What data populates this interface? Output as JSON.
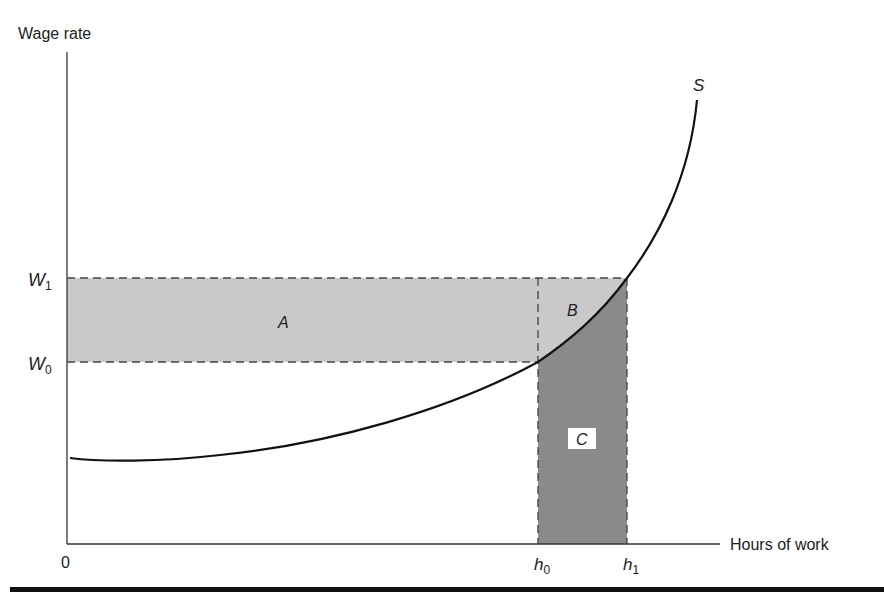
{
  "figure": {
    "y_axis_label": "Wage rate",
    "x_axis_label": "Hours of work",
    "origin_label": "0",
    "curve_label": "S",
    "y_ticks": [
      {
        "base": "W",
        "sub": "1"
      },
      {
        "base": "W",
        "sub": "0"
      }
    ],
    "x_ticks": [
      {
        "base": "h",
        "sub": "0"
      },
      {
        "base": "h",
        "sub": "1"
      }
    ],
    "regions": {
      "A": "A",
      "B": "B",
      "C": "C"
    },
    "colors": {
      "light_fill": "#c9c9c9",
      "dark_fill": "#8a8a8a",
      "curve": "#111111",
      "axis": "#333333",
      "dash": "#444444"
    }
  }
}
